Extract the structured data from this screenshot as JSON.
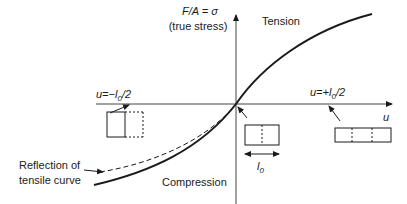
{
  "diagram": {
    "y_axis_label_line1": "F/A = σ",
    "y_axis_label_line2": "(true stress)",
    "x_axis_label": "u",
    "region_tension": "Tension",
    "region_compression": "Compression",
    "annotation_neg": "u = −l0/2",
    "annotation_pos": "u = +l0/2",
    "annotation_neg_parts": {
      "prefix": "u=−",
      "var": "l",
      "sub": "0",
      "suffix": "/2"
    },
    "annotation_pos_parts": {
      "prefix": "u=+",
      "var": "l",
      "sub": "0",
      "suffix": "/2"
    },
    "length_label_parts": {
      "var": "l",
      "sub": "0"
    },
    "reflection_label_line1": "Reflection of",
    "reflection_label_line2": "tensile curve",
    "curves": [
      {
        "name": "true-stress-curve",
        "style": "solid"
      },
      {
        "name": "reflected-tensile-curve",
        "style": "dashed"
      }
    ],
    "specimens": [
      {
        "name": "compressed-specimen",
        "state": "compressed to half length"
      },
      {
        "name": "original-specimen",
        "state": "original length l0"
      },
      {
        "name": "stretched-specimen",
        "state": "stretched to 1.5 l0"
      }
    ],
    "colors": {
      "ink": "#1a1a1a",
      "axis": "#444444",
      "background": "#ffffff"
    }
  }
}
